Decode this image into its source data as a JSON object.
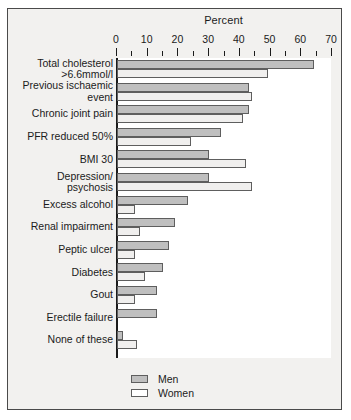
{
  "chart_data": {
    "type": "bar",
    "orientation": "horizontal",
    "title": "Percent",
    "xlabel": "Percent",
    "ylabel": "",
    "xlim": [
      0,
      70
    ],
    "xticks": [
      0,
      10,
      20,
      30,
      40,
      50,
      60,
      70
    ],
    "xtick_labels": [
      "0",
      "10",
      "20",
      "30",
      "40",
      "50",
      "60",
      "70"
    ],
    "minor_tick_interval": 5,
    "grid": false,
    "legend_position": "bottom-left",
    "categories": [
      "Total cholesterol\n>6.6mmol/l",
      "Previous ischaemic\nevent",
      "Chronic joint pain",
      "PFR reduced  50%",
      "BMI  30",
      "Depression/\npsychosis",
      "Excess alcohol",
      "Renal impairment",
      "Peptic ulcer",
      "Diabetes",
      "Gout",
      "Erectile failure",
      "None of these"
    ],
    "series": [
      {
        "name": "Men",
        "color": "#bfbfbf",
        "values": [
          64,
          43,
          43,
          34,
          30,
          30,
          23,
          19,
          17,
          15,
          13,
          13,
          2
        ]
      },
      {
        "name": "Women",
        "color": "#f0efee",
        "values": [
          49,
          44,
          41,
          24,
          42,
          44,
          6,
          7.5,
          6,
          9,
          6,
          0,
          6.5
        ]
      }
    ]
  },
  "legend": {
    "items": [
      {
        "label": "Men",
        "swatch": "men"
      },
      {
        "label": "Women",
        "swatch": "women"
      }
    ]
  }
}
